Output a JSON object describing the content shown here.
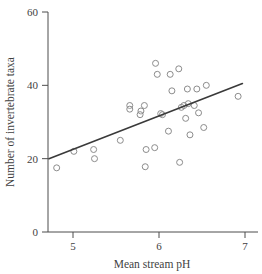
{
  "chart_data": {
    "type": "scatter",
    "title": "",
    "xlabel": "Mean stream pH",
    "ylabel": "Number of invertebrate taxa",
    "xlim": [
      4.6,
      7.05
    ],
    "ylim": [
      0,
      60
    ],
    "xticks": [
      5,
      6,
      7
    ],
    "yticks": [
      0,
      20,
      40,
      60
    ],
    "xtick_labels": [
      "5",
      "6",
      "7"
    ],
    "ytick_labels": [
      "0",
      "20",
      "40",
      "60"
    ],
    "grid": false,
    "legend": "none",
    "marker": "open-circle",
    "marker_color": "#8c8c8c",
    "line_color": "#3a3a3a",
    "points": [
      {
        "x": 4.81,
        "y": 17.5
      },
      {
        "x": 5.01,
        "y": 22.0
      },
      {
        "x": 5.24,
        "y": 22.5
      },
      {
        "x": 5.25,
        "y": 20.0
      },
      {
        "x": 5.55,
        "y": 25.0
      },
      {
        "x": 5.66,
        "y": 34.5
      },
      {
        "x": 5.66,
        "y": 33.5
      },
      {
        "x": 5.79,
        "y": 33.0
      },
      {
        "x": 5.78,
        "y": 32.0
      },
      {
        "x": 5.83,
        "y": 34.5
      },
      {
        "x": 5.85,
        "y": 22.5
      },
      {
        "x": 5.84,
        "y": 17.8
      },
      {
        "x": 5.95,
        "y": 23.0
      },
      {
        "x": 5.96,
        "y": 46.0
      },
      {
        "x": 5.98,
        "y": 43.0
      },
      {
        "x": 6.02,
        "y": 32.3
      },
      {
        "x": 6.04,
        "y": 32.0
      },
      {
        "x": 6.11,
        "y": 27.5
      },
      {
        "x": 6.13,
        "y": 43.0
      },
      {
        "x": 6.15,
        "y": 38.5
      },
      {
        "x": 6.23,
        "y": 44.5
      },
      {
        "x": 6.24,
        "y": 19.0
      },
      {
        "x": 6.26,
        "y": 34.0
      },
      {
        "x": 6.29,
        "y": 34.5
      },
      {
        "x": 6.31,
        "y": 31.0
      },
      {
        "x": 6.33,
        "y": 39.0
      },
      {
        "x": 6.34,
        "y": 35.0
      },
      {
        "x": 6.36,
        "y": 26.5
      },
      {
        "x": 6.41,
        "y": 34.5
      },
      {
        "x": 6.44,
        "y": 39.0
      },
      {
        "x": 6.46,
        "y": 32.5
      },
      {
        "x": 6.52,
        "y": 28.5
      },
      {
        "x": 6.55,
        "y": 40.0
      },
      {
        "x": 6.92,
        "y": 37.0
      }
    ],
    "fit_line": {
      "type": "linear-regression",
      "x_start": 4.72,
      "y_start": 20.0,
      "x_end": 6.97,
      "y_end": 40.5
    }
  }
}
